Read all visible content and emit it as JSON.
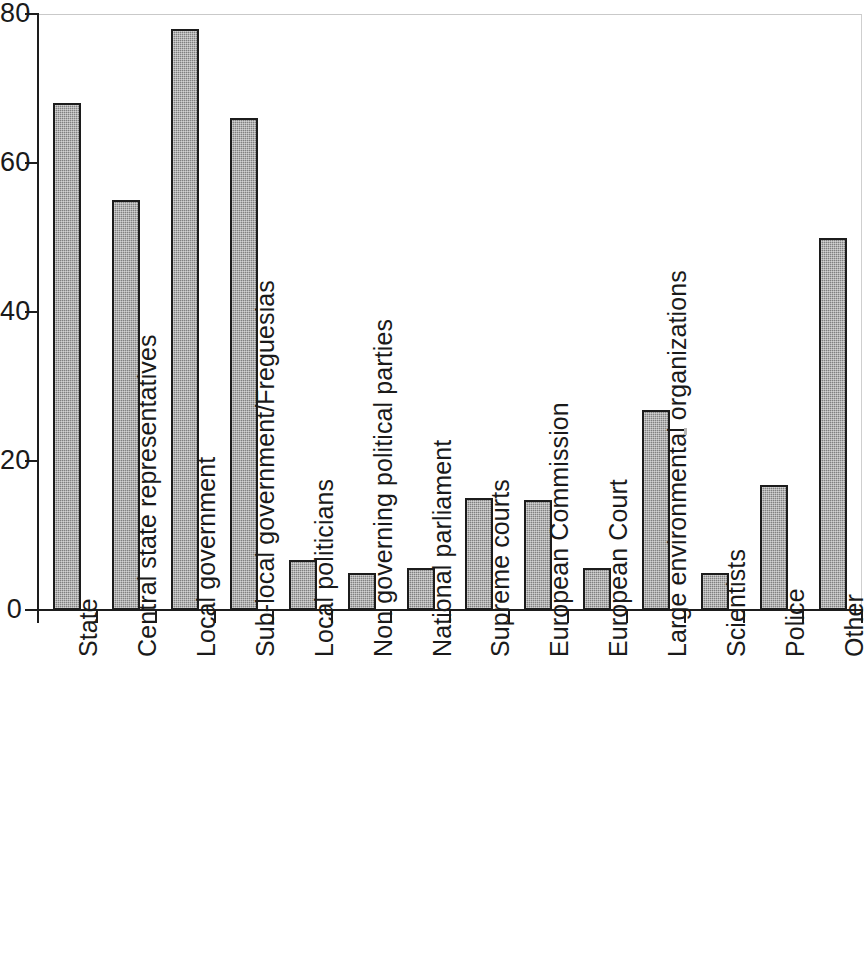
{
  "chart_data": {
    "type": "bar",
    "title": "",
    "subtitle": "",
    "xlabel": "",
    "ylabel": "",
    "ylim": [
      0,
      80
    ],
    "ytick_values": [
      0,
      20,
      40,
      60,
      80
    ],
    "ytick_labels": [
      "0",
      "20",
      "40",
      "60",
      "80"
    ],
    "grid": false,
    "legend": null,
    "legend_position": "none",
    "bar_fill_color": "#8f8f8f",
    "bar_edge_color": "#1c1c1c",
    "axis_color": "#1d1d1d",
    "background_color": "#ffffff",
    "categories": [
      "State",
      "Central state representatives",
      "Local government",
      "Sub-local government/Freguesias",
      "Local politicians",
      "Non governing political parties",
      "National parliament",
      "Supreme courts",
      "European Commission",
      "European Court",
      "Large environmental organizations",
      "Scientists",
      "Police",
      "Other"
    ],
    "values": [
      68,
      55,
      78,
      66,
      6.7,
      5,
      5.7,
      15,
      14.8,
      5.6,
      26.8,
      5,
      16.8,
      50
    ]
  }
}
